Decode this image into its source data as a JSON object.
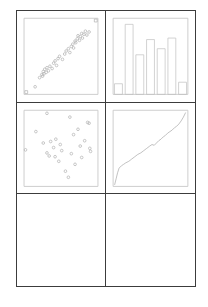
{
  "figure": {
    "background_color": "#ffffff",
    "grid_line_color": "#3c3c3c",
    "plot_frame_color": "#c8c8c8",
    "mark_color": "#b0b0b0",
    "rows": 3,
    "columns": 2,
    "panel_count": 6,
    "filled_panel_count": 4,
    "empty_panel_count": 2
  },
  "panels": [
    {
      "position": "top-left",
      "name": "scatter-correlated-panel",
      "chart_data": {
        "type": "scatter",
        "title": "",
        "xlabel": "",
        "ylabel": "",
        "xlim": [
          0,
          100
        ],
        "ylim": [
          0,
          100
        ],
        "grid": false,
        "legend": "none",
        "marker": "open-circle",
        "corner_marker": "open-square",
        "series": [
          {
            "name": "corner-anchors",
            "marker": "square",
            "x": [
              3,
              97
            ],
            "y": [
              3,
              97
            ]
          },
          {
            "name": "correlated-points",
            "marker": "circle",
            "x": [
              15,
              21,
              24,
              25,
              26,
              27,
              28,
              30,
              31,
              33,
              35,
              38,
              40,
              42,
              44,
              46,
              48,
              52,
              55,
              57,
              60,
              62,
              64,
              66,
              67,
              69,
              70,
              72,
              73,
              75,
              76,
              78,
              79,
              81,
              83,
              85,
              88
            ],
            "y": [
              10,
              22,
              26,
              24,
              30,
              27,
              33,
              29,
              35,
              31,
              37,
              34,
              41,
              44,
              38,
              47,
              50,
              46,
              53,
              57,
              60,
              55,
              63,
              66,
              61,
              70,
              68,
              73,
              77,
              71,
              76,
              80,
              74,
              79,
              83,
              78,
              82
            ]
          }
        ]
      }
    },
    {
      "position": "top-right",
      "name": "histogram-panel",
      "chart_data": {
        "type": "bar",
        "title": "",
        "xlabel": "",
        "ylabel": "",
        "categories": [
          "1",
          "2",
          "3",
          "4",
          "5",
          "6",
          "7"
        ],
        "values": [
          14,
          92,
          52,
          72,
          60,
          74,
          16
        ],
        "ylim": [
          0,
          100
        ],
        "grid": false,
        "legend": "none",
        "bar_fill": "none",
        "bar_edge_color": "#c0c0c0"
      }
    },
    {
      "position": "middle-left",
      "name": "scatter-random-panel",
      "chart_data": {
        "type": "scatter",
        "title": "",
        "xlabel": "",
        "ylabel": "",
        "xlim": [
          0,
          100
        ],
        "ylim": [
          0,
          100
        ],
        "grid": false,
        "legend": "none",
        "marker": "open-circle",
        "series": [
          {
            "name": "random-points",
            "marker": "circle",
            "x": [
              31,
              2,
              16,
              26,
              31,
              36,
              34,
              40,
              43,
              42,
              47,
              49,
              51,
              56,
              62,
              64,
              67,
              69,
              73,
              76,
              78,
              82,
              86,
              88,
              89,
              90,
              60
            ],
            "y": [
              96,
              48,
              72,
              57,
              44,
              59,
              40,
              51,
              62,
              39,
              33,
              55,
              47,
              20,
              91,
              43,
              68,
              29,
              75,
              53,
              38,
              60,
              84,
              83,
              50,
              46,
              12
            ]
          }
        ]
      }
    },
    {
      "position": "middle-right",
      "name": "line-cumulative-panel",
      "chart_data": {
        "type": "line",
        "title": "",
        "xlabel": "",
        "ylabel": "",
        "xlim": [
          0,
          100
        ],
        "ylim": [
          0,
          100
        ],
        "grid": false,
        "legend": "none",
        "line_color": "#a8a8a8",
        "series": [
          {
            "name": "cumulative-curve",
            "x": [
              2,
              4,
              6,
              8,
              11,
              14,
              17,
              21,
              25,
              29,
              33,
              37,
              41,
              45,
              49,
              52,
              55,
              58,
              61,
              64,
              67,
              70,
              73,
              76,
              79,
              82,
              85,
              88,
              91,
              94,
              97
            ],
            "y": [
              2,
              10,
              18,
              24,
              27,
              29,
              31,
              33,
              36,
              39,
              42,
              44,
              47,
              50,
              53,
              55,
              54,
              57,
              60,
              62,
              65,
              67,
              70,
              72,
              74,
              77,
              79,
              82,
              86,
              91,
              97
            ]
          }
        ]
      }
    },
    {
      "position": "bottom-left",
      "name": "empty-panel-left",
      "chart_data": null
    },
    {
      "position": "bottom-right",
      "name": "empty-panel-right",
      "chart_data": null
    }
  ]
}
